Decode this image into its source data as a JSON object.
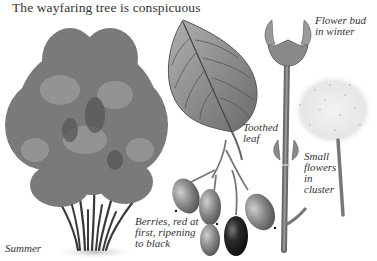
{
  "title": "The wayfaring tree is conspicuous",
  "captions": {
    "summer": "Summer",
    "berries": "Berries, red at\nfirst, ripening\nto black",
    "toothed_leaf": "Toothed\nleaf",
    "flower_bud": "Flower bud\nin winter",
    "small_flowers": "Small\nflowers\nin\ncluster"
  },
  "colors": {
    "background": "#ffffff",
    "foliage": "#7a7a7a",
    "foliage_dark": "#4a4a4a",
    "berry": "#8a8a8a",
    "berry_ripe": "#1e1e1e",
    "text": "#333333"
  }
}
